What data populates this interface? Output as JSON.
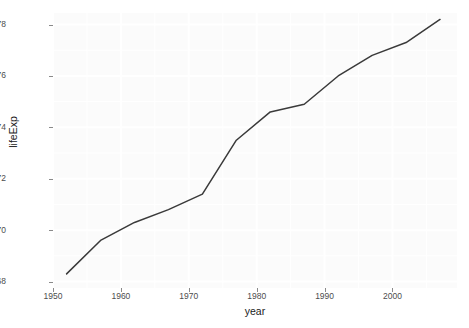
{
  "chart_data": {
    "type": "line",
    "title": "",
    "subtitle": "",
    "xlabel": "year",
    "ylabel": "lifeExp",
    "xlim": [
      1950.0,
      2009.5
    ],
    "ylim": [
      67.75,
      78.45
    ],
    "grid": true,
    "legend": null,
    "x_ticks": [
      1950,
      1960,
      1970,
      1980,
      1990,
      2000
    ],
    "x_tick_labels": [
      "1950",
      "1960",
      "1970",
      "1980",
      "1990",
      "2000"
    ],
    "y_ticks": [
      68,
      70,
      72,
      74,
      76,
      78
    ],
    "y_tick_labels": [
      "68",
      "70",
      "72",
      "74",
      "76",
      "78"
    ],
    "x": [
      1952,
      1957,
      1962,
      1967,
      1972,
      1977,
      1982,
      1987,
      1992,
      1997,
      2002,
      2007
    ],
    "series": [
      {
        "name": "lifeExp",
        "color": "#3a3a3a",
        "x": [
          1952,
          1957,
          1962,
          1967,
          1972,
          1977,
          1982,
          1987,
          1992,
          1997,
          2002,
          2007
        ],
        "values": [
          68.3,
          69.6,
          70.3,
          70.8,
          71.4,
          73.5,
          74.6,
          74.9,
          76.0,
          76.8,
          77.3,
          78.2
        ]
      }
    ],
    "annotations": []
  },
  "style": {
    "panel_background": "#fbfbfb",
    "grid_color": "#ffffff",
    "line_color": "#3a3a3a",
    "tick_label_color": "#4d4d4d",
    "axis_title_color": "#1a1a1a",
    "page_background": "#ffffff"
  }
}
